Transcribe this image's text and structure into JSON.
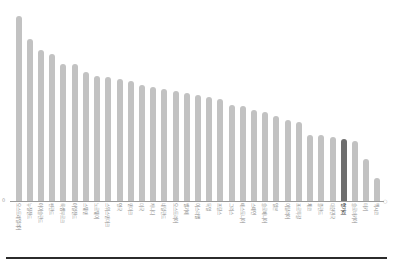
{
  "chart_data": {
    "type": "bar",
    "title": "",
    "subtitle": "",
    "xlabel": "",
    "ylabel": "",
    "ylim": [
      0,
      100
    ],
    "grid": false,
    "legend": null,
    "orientation": "vertical",
    "sorted": "descending",
    "bar_color": "#c2c2c2",
    "highlight_color": "#6e6e6e",
    "highlight_index": 29,
    "axis_color": "#9a9a9a",
    "y_tick_labels": [
      "0"
    ],
    "categories": [
      "오스트레일리아",
      "뉴질랜드",
      "아이슬란드",
      "핀란드",
      "룩셈부르크",
      "아일랜드",
      "스웨덴",
      "노르웨이",
      "스위스덴마크",
      "영국",
      "덴마크",
      "미국",
      "캐나다",
      "네덜란드",
      "오스트리아",
      "벨기에",
      "이스라엘",
      "독일",
      "프랑스",
      "그리스",
      "에스토니아",
      "스페인",
      "슬로베니아",
      "일본",
      "이탈리아",
      "포르투갈",
      "체코",
      "폴란드",
      "대한민국",
      "헝가리",
      "슬로바키아",
      "터키",
      "멕시코"
    ],
    "values": [
      96,
      84,
      78,
      76,
      71,
      71,
      67,
      65,
      64,
      63,
      62,
      60,
      59,
      58,
      57,
      56,
      55,
      54,
      53,
      50,
      49,
      47,
      46,
      44,
      42,
      41,
      34,
      34,
      33,
      32,
      31,
      22,
      12
    ]
  },
  "axis": {
    "zero_label": "0",
    "end_cap": "○"
  }
}
